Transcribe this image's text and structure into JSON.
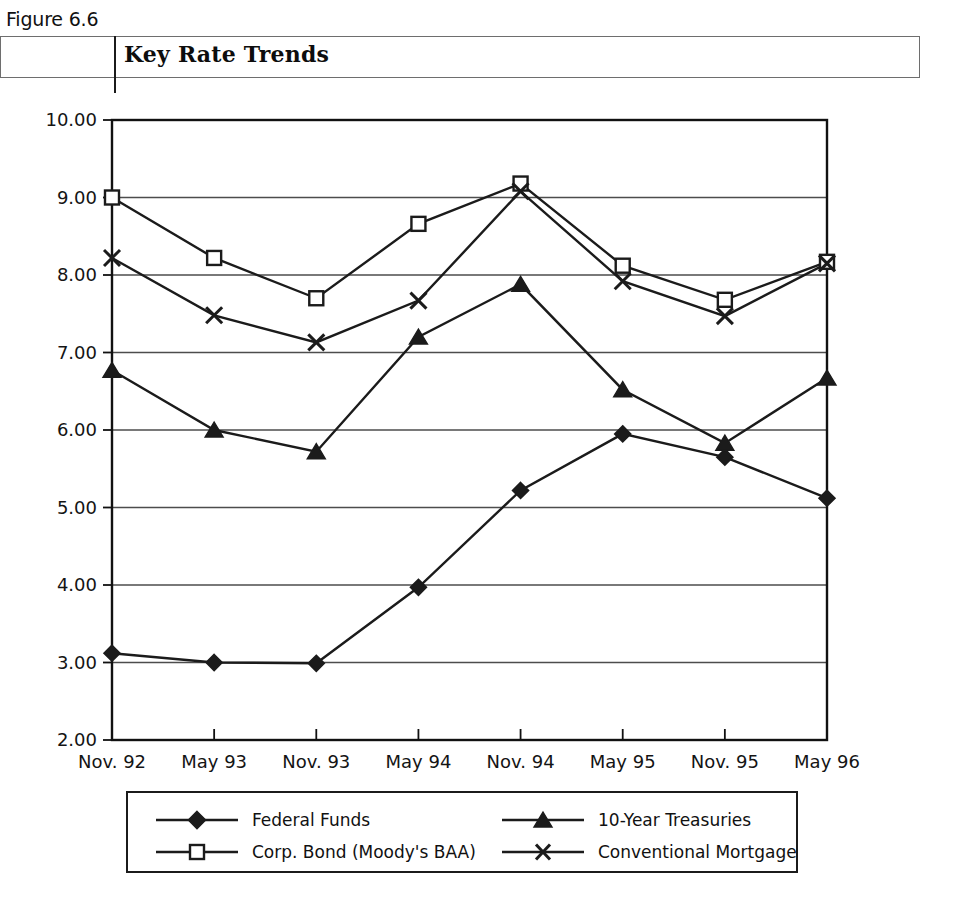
{
  "figure": {
    "number": "Figure 6.6",
    "title": "Key Rate Trends"
  },
  "legend": {
    "entries": [
      {
        "label": "Federal Funds",
        "marker": "filled-diamond-icon"
      },
      {
        "label": "10-Year Treasuries",
        "marker": "filled-triangle-icon"
      },
      {
        "label": "Corp. Bond (Moody's BAA)",
        "marker": "open-square-icon"
      },
      {
        "label": "Conventional Mortgage",
        "marker": "x-cross-icon"
      }
    ]
  },
  "axes": {
    "y_ticks": [
      "2.00",
      "3.00",
      "4.00",
      "5.00",
      "6.00",
      "7.00",
      "8.00",
      "9.00",
      "10.00"
    ],
    "x_ticks": [
      "Nov. 92",
      "May 93",
      "Nov. 93",
      "May 94",
      "Nov. 94",
      "May 95",
      "Nov. 95",
      "May 96"
    ]
  },
  "colors": {
    "line": "#1b1b1b",
    "grid": "#4d4d4d",
    "frame": "#111111",
    "background": "#ffffff"
  },
  "chart_data": {
    "type": "line",
    "title": "Key Rate Trends",
    "xlabel": "",
    "ylabel": "",
    "ylim": [
      2.0,
      10.0
    ],
    "ytick_step": 1.0,
    "grid": true,
    "legend_position": "bottom",
    "categories": [
      "Nov. 92",
      "May 93",
      "Nov. 93",
      "May 94",
      "Nov. 94",
      "May 95",
      "Nov. 95",
      "May 96"
    ],
    "series": [
      {
        "name": "Federal Funds",
        "marker": "filled-diamond",
        "values": [
          3.12,
          3.0,
          2.99,
          3.97,
          5.22,
          5.95,
          5.65,
          5.12
        ]
      },
      {
        "name": "Corp. Bond (Moody's BAA)",
        "marker": "open-square",
        "values": [
          9.0,
          8.22,
          7.7,
          8.66,
          9.18,
          8.12,
          7.68,
          8.17
        ]
      },
      {
        "name": "10-Year Treasuries",
        "marker": "filled-triangle",
        "values": [
          6.77,
          6.0,
          5.72,
          7.2,
          7.88,
          6.52,
          5.83,
          6.67
        ]
      },
      {
        "name": "Conventional Mortgage",
        "marker": "x-cross",
        "values": [
          8.22,
          7.48,
          7.13,
          7.67,
          9.08,
          7.92,
          7.47,
          8.15
        ]
      }
    ]
  }
}
